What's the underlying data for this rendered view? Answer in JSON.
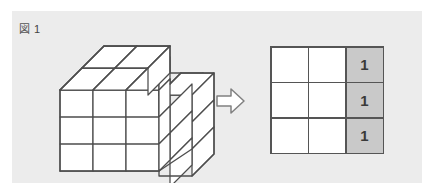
{
  "figure": {
    "label_kanji": "図",
    "label_number": "1"
  },
  "colors": {
    "panel_background": "#ececec",
    "page_background": "#ffffff",
    "stroke": "#4d4d4d",
    "face_fill": "#ffffff",
    "shaded_cell": "#c9c9c9",
    "grid_line": "#555555",
    "text": "#3a3a3a"
  },
  "block_stack": {
    "name": "isometric-block-stack",
    "description": "3x3x3 stacked unit cubes with stepped cut-out at back right",
    "rows": 3,
    "columns": 3,
    "layers": 3
  },
  "arrow": {
    "name": "right-arrow",
    "direction": "right",
    "style": "outlined-block-arrow"
  },
  "result_grid": {
    "rows": 3,
    "columns": 3,
    "cells": [
      [
        {
          "value": "",
          "shaded": false
        },
        {
          "value": "",
          "shaded": false
        },
        {
          "value": "1",
          "shaded": true
        }
      ],
      [
        {
          "value": "",
          "shaded": false
        },
        {
          "value": "",
          "shaded": false
        },
        {
          "value": "1",
          "shaded": true
        }
      ],
      [
        {
          "value": "",
          "shaded": false
        },
        {
          "value": "",
          "shaded": false
        },
        {
          "value": "1",
          "shaded": true
        }
      ]
    ]
  }
}
